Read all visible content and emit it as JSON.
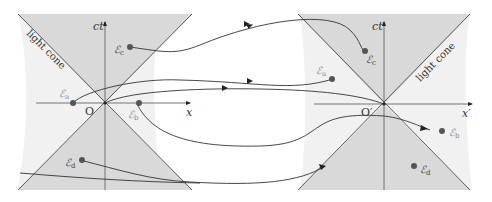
{
  "diagram": {
    "colors": {
      "background": "#ffffff",
      "panel_fill": "#f1f1f1",
      "cone_fill": "#d9d9d9",
      "line": "#333333",
      "event_dot": "#555555"
    },
    "left_frame": {
      "origin_label": "O",
      "time_axis_label": "ct",
      "space_axis_label": "x",
      "cone_label": "light cone",
      "events": [
        {
          "id": "a",
          "symbol": "ℰ",
          "sub": "a"
        },
        {
          "id": "b",
          "symbol": "ℰ",
          "sub": "b"
        },
        {
          "id": "c",
          "symbol": "ℰ",
          "sub": "c"
        },
        {
          "id": "d",
          "symbol": "ℰ",
          "sub": "d"
        }
      ]
    },
    "right_frame": {
      "origin_label": "O′",
      "time_axis_label": "ct′",
      "space_axis_label": "x′",
      "cone_label": "light cone",
      "events": [
        {
          "id": "a",
          "symbol": "ℰ",
          "sub": "a"
        },
        {
          "id": "b",
          "symbol": "ℰ",
          "sub": "b"
        },
        {
          "id": "c",
          "symbol": "ℰ",
          "sub": "c"
        },
        {
          "id": "d",
          "symbol": "ℰ",
          "sub": "d"
        }
      ]
    },
    "mappings": [
      {
        "from": "ℰc (left)",
        "to": "ℰc (right)"
      },
      {
        "from": "ℰa (left)",
        "to": "ℰa (right)"
      },
      {
        "from": "O (left)",
        "to": "O′ (right)"
      },
      {
        "from": "ℰb (left)",
        "to": "ℰb (right)"
      },
      {
        "from": "ℰd (left)",
        "to": "ℰd (right)"
      }
    ]
  }
}
